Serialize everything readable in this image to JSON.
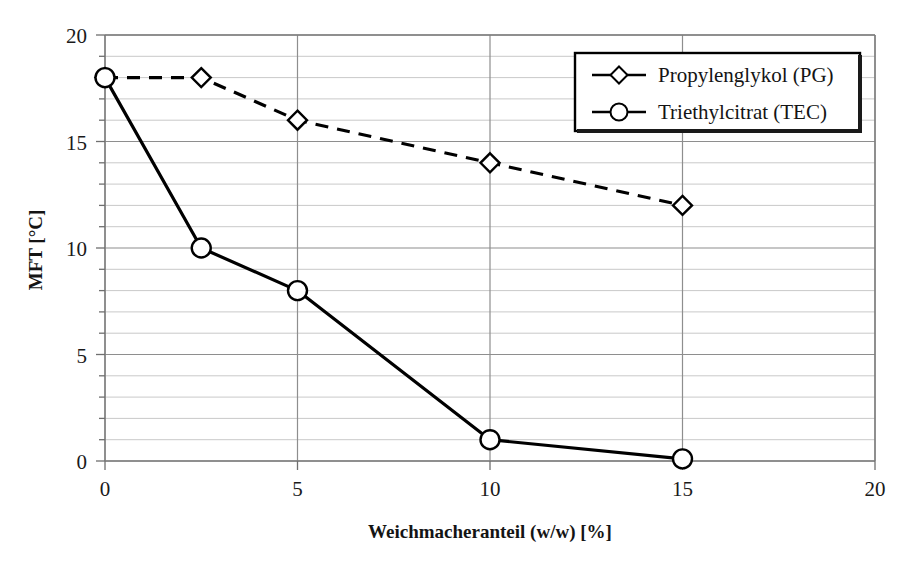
{
  "chart_data": {
    "type": "line",
    "title": "",
    "xlabel": "Weichmacheranteil (w/w) [%]",
    "ylabel": "MFT [°C]",
    "xlim": [
      0,
      20
    ],
    "ylim": [
      0,
      20
    ],
    "xticks": [
      "0",
      "5",
      "10",
      "15",
      "20"
    ],
    "xtick_values": [
      0,
      5,
      10,
      15,
      20
    ],
    "yticks": [
      "0",
      "5",
      "10",
      "15",
      "20"
    ],
    "ytick_values": [
      0,
      5,
      10,
      15,
      20
    ],
    "minor_y_step": 1,
    "grid": "horizontal-minor-and-major, vertical-major",
    "legend_position": "top-right-inside",
    "series": [
      {
        "name": "Propylenglykol (PG)",
        "marker": "diamond",
        "line_style": "dashed",
        "color": "#000000",
        "x": [
          0,
          2.5,
          5,
          10,
          15
        ],
        "values": [
          18,
          18,
          16,
          14,
          12
        ]
      },
      {
        "name": "Triethylcitrat (TEC)",
        "marker": "circle",
        "line_style": "solid",
        "color": "#000000",
        "x": [
          0,
          2.5,
          5,
          10,
          15
        ],
        "values": [
          18,
          10,
          8,
          1,
          0.1
        ]
      }
    ]
  },
  "legend": {
    "entries": [
      {
        "label": "Propylenglykol (PG)",
        "marker": "diamond",
        "line_style": "solid"
      },
      {
        "label": "Triethylcitrat (TEC)",
        "marker": "circle",
        "line_style": "solid"
      }
    ]
  },
  "colors": {
    "plot_line": "#000000",
    "major_grid": "#8c8c8c",
    "minor_grid": "#c9c9c9",
    "axis": "#7d7d7d",
    "text": "#141414",
    "background": "#ffffff"
  }
}
